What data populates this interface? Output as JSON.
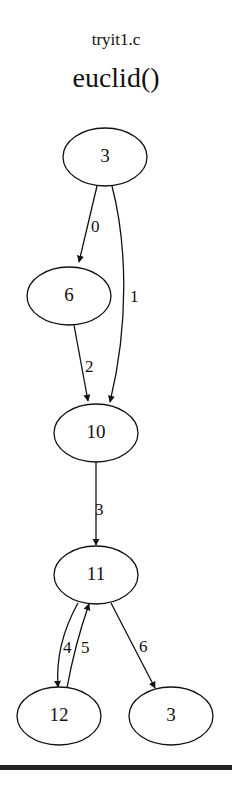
{
  "header": {
    "file_name": "tryit1.c",
    "function_name": "euclid()"
  },
  "graph": {
    "nodes": [
      {
        "id": "n_top3",
        "label": "3",
        "cx": 105,
        "cy": 157
      },
      {
        "id": "n6",
        "label": "6",
        "cx": 69,
        "cy": 296
      },
      {
        "id": "n10",
        "label": "10",
        "cx": 96,
        "cy": 433
      },
      {
        "id": "n11",
        "label": "11",
        "cx": 96,
        "cy": 575
      },
      {
        "id": "n12",
        "label": "12",
        "cx": 59,
        "cy": 716
      },
      {
        "id": "n_bot3",
        "label": "3",
        "cx": 171,
        "cy": 716
      }
    ],
    "edges": [
      {
        "from": "n_top3",
        "to": "n6",
        "label": "0"
      },
      {
        "from": "n_top3",
        "to": "n10",
        "label": "1"
      },
      {
        "from": "n6",
        "to": "n10",
        "label": "2"
      },
      {
        "from": "n10",
        "to": "n11",
        "label": "3"
      },
      {
        "from": "n11",
        "to": "n12",
        "label": "4"
      },
      {
        "from": "n12",
        "to": "n11",
        "label": "5"
      },
      {
        "from": "n11",
        "to": "n_bot3",
        "label": "6"
      }
    ]
  }
}
